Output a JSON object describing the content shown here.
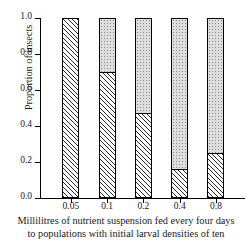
{
  "chart_data": {
    "type": "bar",
    "subtype": "stacked-bar-100",
    "title": "",
    "xlabel": "Millilitres of nutrient suspension fed every four days to populations with initial larval densities of ten",
    "ylabel": "Proportion of insects",
    "categories": [
      "0.05",
      "0.1",
      "0.2",
      "0.4",
      "0.8"
    ],
    "series": [
      {
        "name": "hatched",
        "values": [
          1.0,
          0.7,
          0.47,
          0.16,
          0.25
        ]
      },
      {
        "name": "stippled",
        "values": [
          0.0,
          0.3,
          0.53,
          0.84,
          0.75
        ]
      }
    ],
    "ylim": [
      0.0,
      1.0
    ],
    "yticks": [
      "0.0",
      "0.2",
      "0.4",
      "0.6",
      "0.8",
      "1.0"
    ],
    "ytick_values": [
      0.0,
      0.2,
      0.4,
      0.6,
      0.8,
      1.0
    ],
    "grid": false,
    "legend": "none"
  },
  "axis": {
    "y_title": "Proportion of insects",
    "y_ticks": [
      {
        "label": "1.0",
        "value": 1.0
      },
      {
        "label": "0.8",
        "value": 0.8
      },
      {
        "label": "0.6",
        "value": 0.6
      },
      {
        "label": "0.4",
        "value": 0.4
      },
      {
        "label": "0.2",
        "value": 0.2
      },
      {
        "label": "0.0",
        "value": 0.0
      }
    ],
    "x_ticks": [
      {
        "label": "0.05"
      },
      {
        "label": "0.1"
      },
      {
        "label": "0.2"
      },
      {
        "label": "0.4"
      },
      {
        "label": "0.8"
      }
    ]
  },
  "caption": {
    "line1": "Millilitres of nutrient suspension fed every four days",
    "line2": "to populations with initial larval densities of ten"
  },
  "colors": {
    "axis": "#000000",
    "hatch": "#2a2a2a",
    "stipple": "#dedede",
    "background": "#ffffff"
  }
}
